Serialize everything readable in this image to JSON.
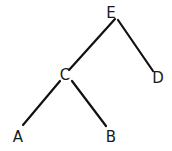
{
  "diagram": {
    "type": "tree",
    "nodes": [
      {
        "id": "E",
        "label": "E",
        "x": 111,
        "y": 13
      },
      {
        "id": "C",
        "label": "C",
        "x": 65,
        "y": 75
      },
      {
        "id": "D",
        "label": "D",
        "x": 158,
        "y": 78
      },
      {
        "id": "A",
        "label": "A",
        "x": 18,
        "y": 137
      },
      {
        "id": "B",
        "label": "B",
        "x": 111,
        "y": 137
      }
    ],
    "edges": [
      {
        "from": "E",
        "to": "C",
        "x1": 115,
        "y1": 19,
        "x2": 69,
        "y2": 70
      },
      {
        "from": "E",
        "to": "D",
        "x1": 118,
        "y1": 20,
        "x2": 153,
        "y2": 71
      },
      {
        "from": "C",
        "to": "A",
        "x1": 60,
        "y1": 81,
        "x2": 23,
        "y2": 125
      },
      {
        "from": "C",
        "to": "B",
        "x1": 72,
        "y1": 81,
        "x2": 106,
        "y2": 126
      }
    ],
    "stroke_color": "#111111",
    "label_color": "#1a1a1a"
  }
}
